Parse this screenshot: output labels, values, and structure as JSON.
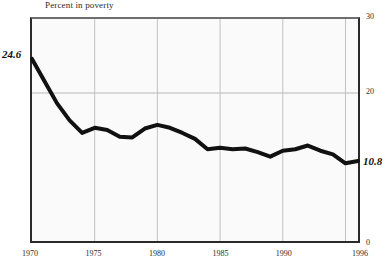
{
  "chart_data": {
    "type": "line",
    "title": "Percent in poverty",
    "xlabel": "",
    "ylabel": "Percent in poverty",
    "ylim": [
      0,
      30
    ],
    "xlim": [
      1970,
      1996
    ],
    "grid": true,
    "grid_y_values": [
      20
    ],
    "grid_x_values": [
      1975,
      1980,
      1985,
      1990,
      1995
    ],
    "y_tick_labels": [
      "30",
      "20",
      "0"
    ],
    "y_tick_values": [
      30,
      20,
      0
    ],
    "x_tick_labels": [
      "1970",
      "1975",
      "1980",
      "1985",
      "1990",
      "1996"
    ],
    "x_tick_values": [
      1970,
      1975,
      1980,
      1985,
      1990,
      1996
    ],
    "legend": null,
    "series": [
      {
        "name": "Percent in poverty",
        "line_color": "#111111",
        "line_width": 4,
        "x": [
          1970,
          1971,
          1972,
          1973,
          1974,
          1975,
          1976,
          1977,
          1978,
          1979,
          1980,
          1981,
          1982,
          1983,
          1984,
          1985,
          1986,
          1987,
          1988,
          1989,
          1990,
          1991,
          1992,
          1993,
          1994,
          1995,
          1996
        ],
        "values": [
          24.6,
          21.6,
          18.6,
          16.3,
          14.6,
          15.3,
          15.0,
          14.1,
          14.0,
          15.2,
          15.7,
          15.3,
          14.6,
          13.8,
          12.4,
          12.6,
          12.4,
          12.5,
          12.0,
          11.4,
          12.2,
          12.4,
          12.9,
          12.2,
          11.7,
          10.5,
          10.8
        ]
      }
    ],
    "annotations": [
      {
        "name": "start-value-label",
        "text": "24.6",
        "x": 1970,
        "y": 24.6
      },
      {
        "name": "end-value-label",
        "text": "10.8",
        "x": 1996,
        "y": 10.8
      }
    ]
  }
}
